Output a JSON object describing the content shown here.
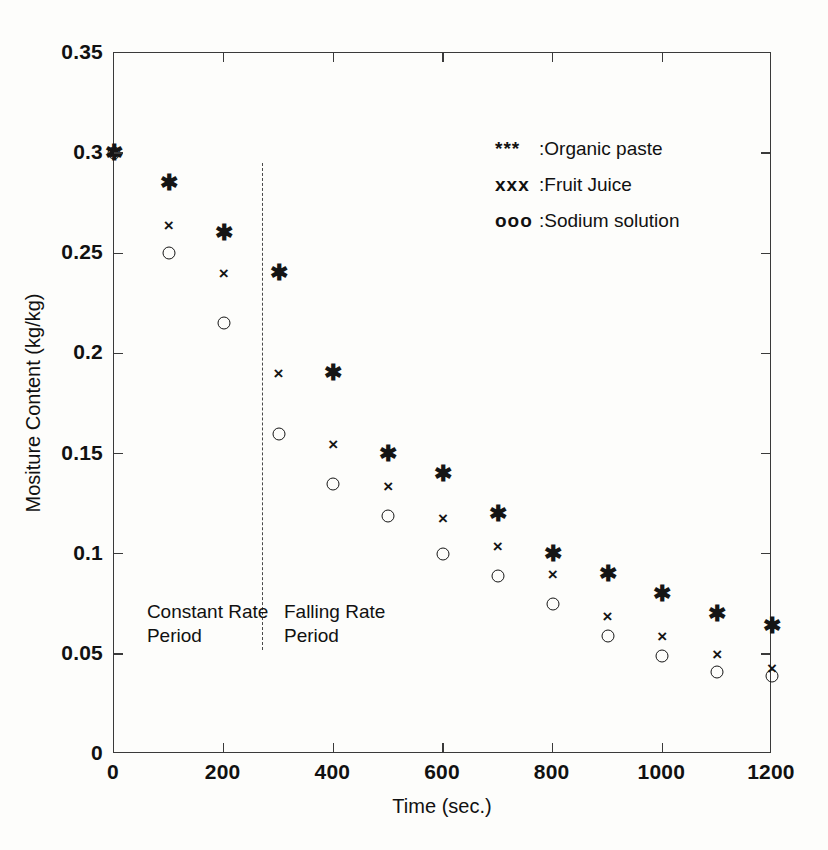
{
  "chart_data": {
    "type": "scatter",
    "title": "",
    "xlabel": "Time (sec.)",
    "ylabel": "Mositure Content (kg/kg)",
    "xlim": [
      0,
      1200
    ],
    "ylim": [
      0,
      0.35
    ],
    "xticks": [
      0,
      200,
      400,
      600,
      800,
      1000,
      1200
    ],
    "yticks": [
      0,
      0.05,
      0.1,
      0.15,
      0.2,
      0.25,
      0.3,
      0.35
    ],
    "xtick_labels": [
      "0",
      "200",
      "400",
      "600",
      "800",
      "1000",
      "1200"
    ],
    "ytick_labels": [
      "0",
      "0.05",
      "0.1",
      "0.15",
      "0.2",
      "0.25",
      "0.3",
      "0.35"
    ],
    "grid": false,
    "legend_position": "upper right",
    "series": [
      {
        "name": "Organic paste",
        "marker": "*",
        "x": [
          0,
          100,
          200,
          300,
          400,
          500,
          600,
          700,
          800,
          900,
          1000,
          1100,
          1200
        ],
        "y": [
          0.3,
          0.285,
          0.26,
          0.24,
          0.19,
          0.15,
          0.14,
          0.12,
          0.1,
          0.09,
          0.08,
          0.07,
          0.064
        ]
      },
      {
        "name": "Fruit Juice",
        "marker": "x",
        "x": [
          0,
          100,
          200,
          300,
          400,
          500,
          600,
          700,
          800,
          900,
          1000,
          1100,
          1200
        ],
        "y": [
          0.3,
          0.264,
          0.24,
          0.19,
          0.155,
          0.134,
          0.118,
          0.104,
          0.09,
          0.069,
          0.059,
          0.05,
          0.043
        ]
      },
      {
        "name": "Sodium solution",
        "marker": "o",
        "x": [
          0,
          100,
          200,
          300,
          400,
          500,
          600,
          700,
          800,
          900,
          1000,
          1100,
          1200
        ],
        "y": [
          0.3,
          0.25,
          0.215,
          0.16,
          0.135,
          0.119,
          0.1,
          0.089,
          0.075,
          0.059,
          0.049,
          0.041,
          0.039
        ]
      }
    ],
    "annotations": [
      {
        "name": "constant-rate-period",
        "text": "Constant Rate\nPeriod",
        "x": 60,
        "y": 0.077
      },
      {
        "name": "falling-rate-period",
        "text": "Falling Rate\nPeriod",
        "x": 310,
        "y": 0.077
      }
    ],
    "divider": {
      "x": 270,
      "style": "dashed",
      "y_top": 0.295,
      "y_bottom": 0.052
    }
  },
  "legend": {
    "entries": [
      {
        "symbol": "***",
        "separator": ":",
        "label": "Organic paste"
      },
      {
        "symbol": "xxx",
        "separator": ":",
        "label": "Fruit Juice"
      },
      {
        "symbol": "ooo",
        "separator": ":",
        "label": "Sodium solution"
      }
    ]
  }
}
